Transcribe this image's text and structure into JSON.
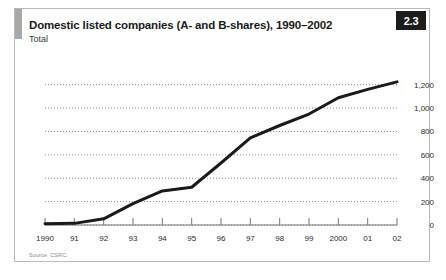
{
  "figure": {
    "badge": "2.3",
    "title": "Domestic listed companies (A- and B-shares), 1990–2002",
    "subtitle": "Total",
    "source": "Source: CSRC."
  },
  "chart_data": {
    "type": "line",
    "title": "Domestic listed companies (A- and B-shares), 1990–2002",
    "subtitle": "Total",
    "xlabel": "",
    "ylabel": "",
    "categories": [
      "1990",
      "91",
      "92",
      "93",
      "94",
      "95",
      "96",
      "97",
      "98",
      "99",
      "2000",
      "01",
      "02"
    ],
    "x_values": [
      1990,
      1991,
      1992,
      1993,
      1994,
      1995,
      1996,
      1997,
      1998,
      1999,
      2000,
      2001,
      2002
    ],
    "values": [
      10,
      14,
      53,
      183,
      291,
      323,
      530,
      745,
      851,
      949,
      1088,
      1160,
      1224
    ],
    "ylim": [
      0,
      1300
    ],
    "yticks": [
      0,
      200,
      400,
      600,
      800,
      1000,
      1200
    ],
    "ytick_labels": [
      "0",
      "200",
      "400",
      "600",
      "800",
      "1,000",
      "1,200"
    ],
    "grid": true,
    "grid_style": "dotted",
    "legend": false,
    "line_color": "#1a1a1a",
    "line_width": 3
  }
}
